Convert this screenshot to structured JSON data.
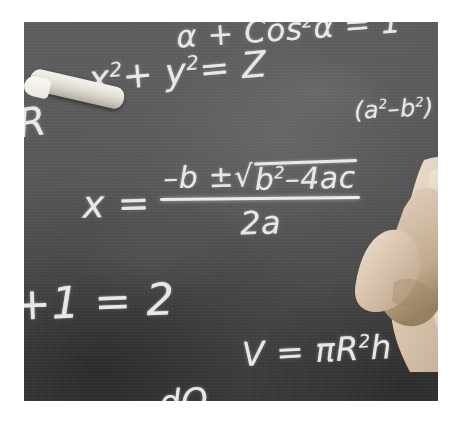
{
  "image": {
    "subject": "hand-writing-equations-on-chalkboard",
    "palette": {
      "page_background": "#ffffff",
      "board_light": "#5d5d5d",
      "board_mid": "#515151",
      "board_dark": "#3c3c3c",
      "chalk": "#e8e8e4",
      "skin": "#d8c3ad"
    }
  },
  "board": {
    "equations": {
      "trig_identity": "α + Cos",
      "trig_identity_exp": "2",
      "trig_identity_tail": "α = 1",
      "pythagorean_lhs": "x",
      "pythagorean_exp1": "2",
      "pythagorean_mid": "+ y",
      "pythagorean_exp2": "2",
      "pythagorean_rhs": "= Z",
      "left_letter": "R",
      "difference_of_squares": "(a",
      "difference_of_squares_exp1": "2",
      "difference_of_squares_mid": "–b",
      "difference_of_squares_exp2": "2",
      "difference_of_squares_tail": ")",
      "quadratic_lhs": "x =",
      "quadratic_numer_lead": "–b ±",
      "quadratic_radical_sign": "√",
      "quadratic_radicand": "b",
      "quadratic_radicand_exp": "2",
      "quadratic_radicand_tail": "–4ac",
      "quadratic_denom": "2a",
      "plus_one_equals_two": "+1 = 2",
      "cylinder_volume": "V = πR",
      "cylinder_volume_exp": "2",
      "cylinder_volume_tail": "h",
      "bottom_partial": "dQ"
    }
  },
  "hand": {
    "label": "hand-holding-chalk",
    "chalk_label": "chalk-stick"
  }
}
